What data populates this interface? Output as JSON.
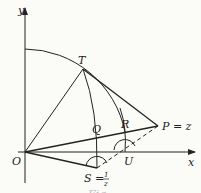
{
  "diagram": {
    "axes": {
      "x_label": "x",
      "y_label": "y",
      "origin_label": "O"
    },
    "points": {
      "T": "T",
      "Q": "Q",
      "R": "R",
      "P": "P = z",
      "U": "U",
      "S_main": "S =",
      "S_num": "1",
      "S_den": "z"
    },
    "caption": "Fig."
  }
}
